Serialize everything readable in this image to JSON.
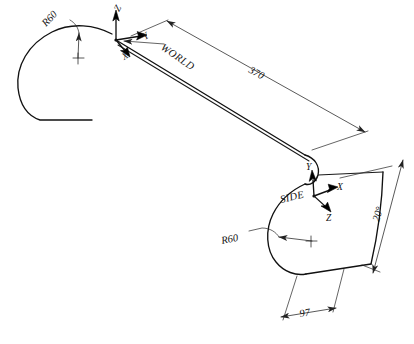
{
  "drawing": {
    "title": "Swept solid isometric view",
    "background_color": "#ffffff",
    "line_color": "#111111",
    "dimension_color": "#222222"
  },
  "coordinate_systems": [
    {
      "name": "WORLD",
      "label": "WORLD",
      "axes": [
        {
          "label": "Z",
          "direction": "up"
        },
        {
          "label": "Y",
          "direction": "right"
        },
        {
          "label": "X",
          "direction": "down-left"
        }
      ]
    },
    {
      "name": "SIDE",
      "label": "SIDE",
      "axes": [
        {
          "label": "Y",
          "direction": "up"
        },
        {
          "label": "X",
          "direction": "right"
        },
        {
          "label": "Z",
          "direction": "down-right"
        }
      ]
    }
  ],
  "dimensions": [
    {
      "id": "sweep-length",
      "value": "370",
      "type": "linear"
    },
    {
      "id": "profile-width",
      "value": "97",
      "type": "linear"
    },
    {
      "id": "profile-height",
      "value": "20°",
      "type": "linear"
    },
    {
      "id": "radius-world",
      "value": "R60",
      "type": "radius"
    },
    {
      "id": "radius-side",
      "value": "R60",
      "type": "radius"
    }
  ],
  "labels": {
    "world_cs": "WORLD",
    "side_cs": "SIDE",
    "world_axis_z": "Z",
    "world_axis_y": "Y",
    "world_axis_x": "X",
    "side_axis_y": "Y",
    "side_axis_x": "X",
    "side_axis_z": "Z",
    "dim_370": "370",
    "dim_97": "97",
    "dim_20": "20°",
    "radius_top_left": "R60",
    "radius_bottom": "R60"
  }
}
